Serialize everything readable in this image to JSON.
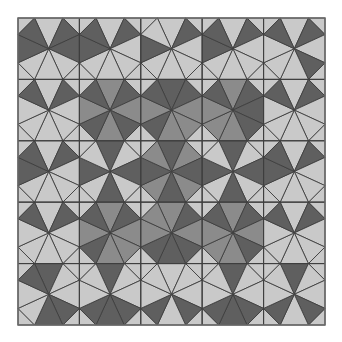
{
  "figure": {
    "grid": {
      "cols": 5,
      "rows": 5,
      "origin_x": 18,
      "origin_y": 18,
      "size": 307,
      "edge_fraction": 0.27
    },
    "colors": {
      "dark": "#5f5f5f",
      "medium": "#8b8b8b",
      "light": "#c9c9c9",
      "line": "#3e3e3e",
      "frame": "#6a6a6a"
    },
    "spoke_order": [
      "N",
      "NE",
      "E",
      "SE",
      "S",
      "SW",
      "W",
      "NW"
    ],
    "cells": [
      [
        "lddllldd",
        "ldlllldd",
        "ldlllldl",
        "ldlllldd",
        "ldldllld"
      ],
      [
        "ldllllld",
        "mdmdmdmd",
        "ddmmmdmd",
        "mdddmmmd",
        "ldllllld"
      ],
      [
        "ldlllldd",
        "dldldldl",
        "dmdmdmdm",
        "dldldldl",
        "ldlllldd"
      ],
      [
        "ldllllld",
        "mdmmmdmd",
        "mdmdddmm",
        "mdmdmmmd",
        "ldllllld"
      ],
      [
        "dllddlld",
        "dlldddll",
        "llldldll",
        "dlldddll",
        "dlldldll"
      ]
    ]
  }
}
